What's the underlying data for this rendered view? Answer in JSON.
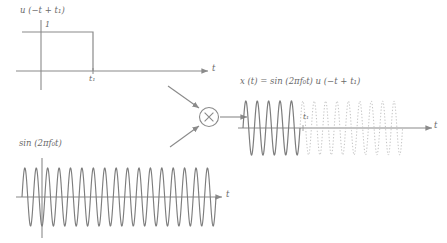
{
  "figure": {
    "title_hidden": "",
    "colors": {
      "background": "#ffffff",
      "curve": "#7d7d7d",
      "axis": "#8a8a8a",
      "dotted_curve": "#bdbdbd",
      "text": "#6a6a6a"
    }
  },
  "panels": {
    "step": {
      "name": "unit-step-plot",
      "signal_label": "u (−t + t₁)",
      "amplitude_label": "1",
      "x_axis_label": "t",
      "tick_label": "t₁",
      "amplitude_value": 1,
      "step_edge_at": "t₁"
    },
    "sine": {
      "name": "sine-plot",
      "signal_label": "sin (2πf₀t)",
      "x_axis_label": "t",
      "cycles_visible": 17
    },
    "product": {
      "name": "product-plot",
      "signal_label": "x (t) = sin (2πf₀t) u (−t + t₁)",
      "x_axis_label": "t",
      "tick_label": "t₁",
      "solid_segment": "t < t₁",
      "dotted_segment": "t > t₁",
      "cycles_solid": 5,
      "cycles_dotted": 9
    }
  },
  "multiplier": {
    "name": "multiplier-block",
    "symbol": "×",
    "input_top_from": "unit-step-plot",
    "input_bottom_from": "sine-plot",
    "output_to": "product-plot"
  },
  "chart_data": {
    "type": "line",
    "xlabel": "t",
    "ylabel": "",
    "grid": false,
    "legend": "none",
    "series": [
      {
        "name": "u (−t + t₁)",
        "panel": "step",
        "description": "Unit step of amplitude 1 for t < t₁, zero for t > t₁",
        "x": [
          -1.0,
          0.0,
          1.0,
          1.0,
          2.4
        ],
        "values": [
          1,
          1,
          1,
          0,
          0
        ],
        "ylim": [
          0,
          1.25
        ],
        "markers": [
          {
            "label": "t₁",
            "x": 1.0
          },
          {
            "label": "1",
            "y": 1
          }
        ]
      },
      {
        "name": "sin (2πf₀t)",
        "panel": "sine",
        "description": "Continuous sinusoid, 17 visible cycles, unit amplitude",
        "frequency_cycles_over_span": 17,
        "amplitude": 1,
        "ylim": [
          -1.15,
          1.15
        ]
      },
      {
        "name": "x (t) = sin (2πf₀t) u (−t + t₁)",
        "panel": "product",
        "description": "Sinusoid shown solid for t < t₁ and dotted (suppressed) for t > t₁",
        "amplitude": 1,
        "cycles_solid": 5,
        "cycles_dotted": 9,
        "cut_at": "t₁",
        "ylim": [
          -1.15,
          1.15
        ]
      }
    ]
  }
}
